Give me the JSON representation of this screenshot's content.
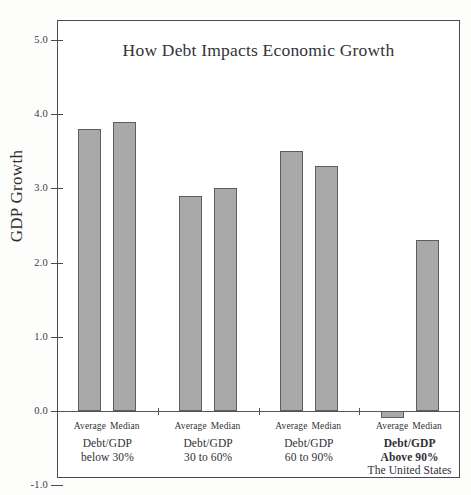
{
  "chart_data": {
    "type": "bar",
    "title": "How Debt Impacts Economic Growth",
    "xlabel": "",
    "ylabel": "GDP Growth",
    "ylim": [
      -1.0,
      5.4
    ],
    "yticks": [
      "5.0",
      "4.0",
      "3.0",
      "2.0",
      "1.0",
      "0.0",
      "-1.0"
    ],
    "ytick_values": [
      5.0,
      4.0,
      3.0,
      2.0,
      1.0,
      0.0,
      -1.0
    ],
    "grid": false,
    "legend": "none",
    "bar_color": "#a9a9a9",
    "bar_edge_color": "#5c5c62",
    "categories": [
      "Debt/GDP below 30%",
      "Debt/GDP 30 to 60%",
      "Debt/GDP 60 to 90%",
      "Debt/GDP Above 90%"
    ],
    "series": [
      {
        "name": "Average",
        "values": [
          3.8,
          2.9,
          3.5,
          -0.1
        ]
      },
      {
        "name": "Median",
        "values": [
          3.9,
          3.0,
          3.3,
          2.3
        ]
      }
    ],
    "groups": [
      {
        "line1": "Debt/GDP",
        "line2": "below 30%",
        "bold": false,
        "note": "",
        "bars": [
          {
            "label": "Average",
            "value": 3.8
          },
          {
            "label": "Median",
            "value": 3.9
          }
        ]
      },
      {
        "line1": "Debt/GDP",
        "line2": "30 to 60%",
        "bold": false,
        "note": "",
        "bars": [
          {
            "label": "Average",
            "value": 2.9
          },
          {
            "label": "Median",
            "value": 3.0
          }
        ]
      },
      {
        "line1": "Debt/GDP",
        "line2": "60 to 90%",
        "bold": false,
        "note": "",
        "bars": [
          {
            "label": "Average",
            "value": 3.5
          },
          {
            "label": "Median",
            "value": 3.3
          }
        ]
      },
      {
        "line1": "Debt/GDP",
        "line2": "Above 90%",
        "bold": true,
        "note": "The United States",
        "bars": [
          {
            "label": "Average",
            "value": -0.1
          },
          {
            "label": "Median",
            "value": 2.3
          }
        ]
      }
    ]
  }
}
